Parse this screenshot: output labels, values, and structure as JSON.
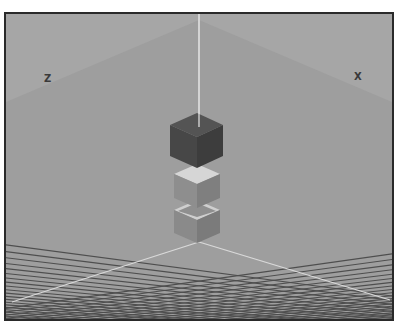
{
  "viewport": {
    "name": "3D perspective viewport",
    "background_color": "#a3a3a3",
    "grid_color": "#4e4e4e",
    "axis_line_color": "#d8d8d8",
    "frame_color": "#2a2a2a"
  },
  "axes": {
    "z_label": "Z",
    "x_label": "X"
  },
  "objects": [
    {
      "name": "selected-cube",
      "state": "selected",
      "color": "#4a4a4a"
    },
    {
      "name": "cube-middle",
      "state": "unselected",
      "color": "#8c8c8c"
    },
    {
      "name": "cube-bottom",
      "state": "unselected",
      "color": "#8c8c8c"
    }
  ]
}
